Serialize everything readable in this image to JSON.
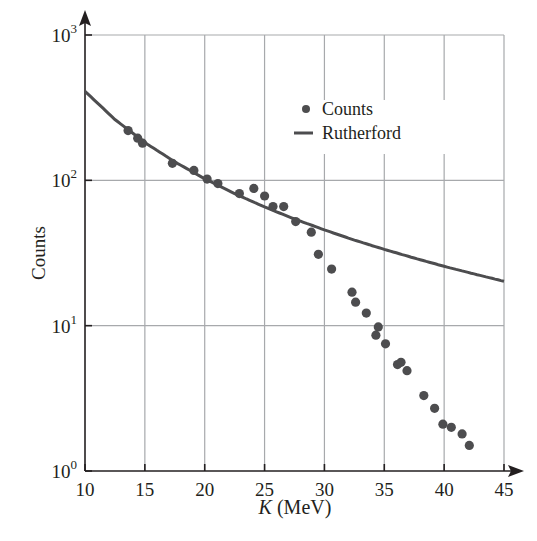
{
  "chart_data": {
    "type": "scatter",
    "title": "",
    "xlabel": "K (MeV)",
    "xlabel_italic": "K",
    "xlabel_unit": " (MeV)",
    "ylabel": "Counts",
    "xlim": [
      10,
      45
    ],
    "ylim": [
      1,
      1000
    ],
    "yscale": "log",
    "grid": true,
    "legend_position": "upper-right-inside",
    "x_ticks": [
      10,
      15,
      20,
      25,
      30,
      35,
      40,
      45
    ],
    "y_ticks": [
      {
        "value": 1,
        "base": "10",
        "exp": "0"
      },
      {
        "value": 10,
        "base": "10",
        "exp": "1"
      },
      {
        "value": 100,
        "base": "10",
        "exp": "2"
      },
      {
        "value": 1000,
        "base": "10",
        "exp": "3"
      }
    ],
    "series": [
      {
        "name": "Counts",
        "kind": "scatter",
        "color": "#4d4d4f",
        "x": [
          13.6,
          14.4,
          14.8,
          17.3,
          19.1,
          20.2,
          21.1,
          22.9,
          24.1,
          25.0,
          25.7,
          26.6,
          27.6,
          28.9,
          29.5,
          30.6,
          32.3,
          32.6,
          33.5,
          34.5,
          34.3,
          35.1,
          36.1,
          36.4,
          36.9,
          38.3,
          39.2,
          39.9,
          40.6,
          41.5,
          42.1
        ],
        "y": [
          220,
          195,
          180,
          131,
          117,
          102,
          95,
          81,
          88,
          78,
          66,
          66,
          52,
          44,
          31,
          24.5,
          17,
          14.5,
          12.2,
          9.8,
          8.6,
          7.5,
          5.4,
          5.6,
          4.9,
          3.3,
          2.7,
          2.1,
          2.0,
          1.8,
          1.5
        ]
      },
      {
        "name": "Rutherford",
        "kind": "line",
        "color": "#4d4d4f",
        "formula": "41000 / K^2",
        "x": [
          10,
          12.5,
          15,
          17.5,
          20,
          22.5,
          25,
          27.5,
          30,
          32.5,
          35,
          37.5,
          40,
          42.5,
          45
        ],
        "y": [
          410,
          262,
          182,
          134,
          102.5,
          81,
          65.6,
          54.2,
          45.6,
          38.8,
          33.5,
          29.2,
          25.6,
          22.7,
          20.2
        ]
      }
    ],
    "legend": [
      {
        "label": "Counts",
        "marker": "dot"
      },
      {
        "label": "Rutherford",
        "marker": "line"
      }
    ]
  }
}
